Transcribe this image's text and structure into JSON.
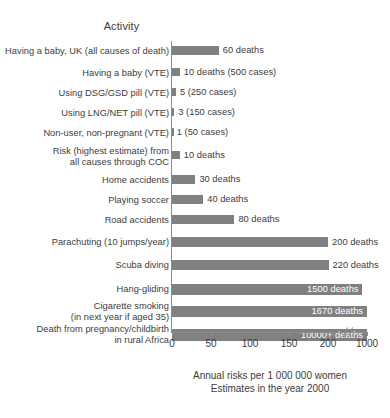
{
  "chart_data": {
    "type": "bar",
    "orientation": "horizontal",
    "title": "Activity",
    "xlabel": "Annual risks per 1 000 000 women",
    "sublabel": "Estimates in the year 2000",
    "ylabel": "",
    "grid": false,
    "legend": "none",
    "axis_ticks": [
      "0",
      "50",
      "100",
      "150",
      "200",
      "1000"
    ],
    "axis_tick_values": [
      0,
      50,
      100,
      150,
      200,
      1000
    ],
    "axis_break_after": 200,
    "xlim": [
      0,
      1000
    ],
    "bar_color": "#808080",
    "categories": [
      "Having a baby, UK (all causes of death)",
      "Having a baby (VTE)",
      "Using DSG/GSD pill (VTE)",
      "Using LNG/NET pill (VTE)",
      "Non-user, non-pregnant (VTE)",
      "Risk (highest estimate) from\nall causes through COC",
      "Home accidents",
      "Playing soccer",
      "Road accidents",
      "Parachuting (10 jumps/year)",
      "Scuba diving",
      "Hang-gliding",
      "Cigarette smoking\n(in next year if aged 35)",
      "Death from pregnancy/childbirth\nin rural Africa"
    ],
    "values": [
      60,
      10,
      5,
      3,
      1,
      10,
      30,
      40,
      80,
      200,
      220,
      1500,
      1670,
      10000
    ],
    "value_labels": [
      "60 deaths",
      "10 deaths (500 cases)",
      "5 (250 cases)",
      "3 (150 cases)",
      "1 (50 cases)",
      "10 deaths",
      "30 deaths",
      "40 deaths",
      "80 deaths",
      "200 deaths",
      "220 deaths",
      "1500 deaths",
      "1670 deaths",
      "10000+ deaths"
    ],
    "label_inside_bar": [
      false,
      false,
      false,
      false,
      false,
      false,
      false,
      false,
      false,
      false,
      false,
      true,
      true,
      true
    ]
  },
  "footer": {
    "line1": "Annual risks per 1 000 000 women",
    "line2": "Estimates in the year 2000"
  }
}
